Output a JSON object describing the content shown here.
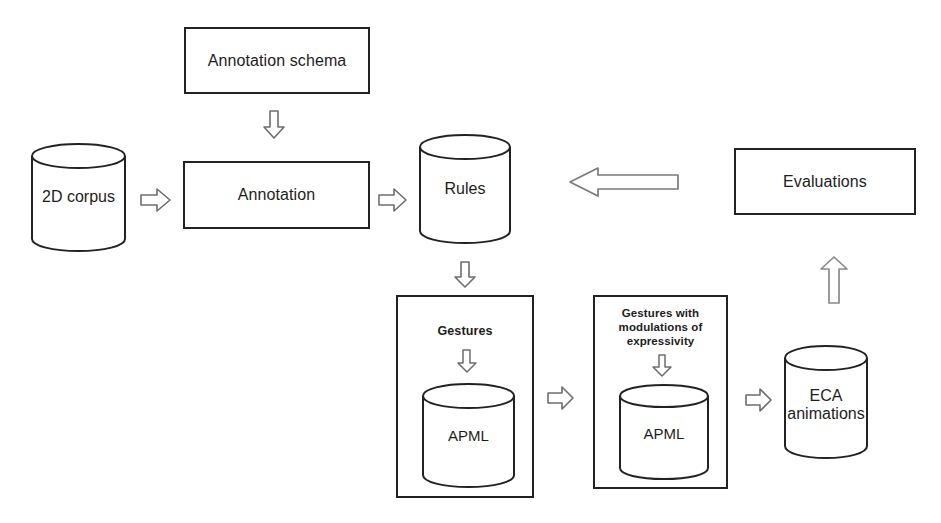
{
  "diagram": {
    "background_color": "#ffffff",
    "stroke_color": "#222222",
    "arrow_stroke_color": "#6d6d6d",
    "nodes": {
      "corpus": {
        "label": "2D corpus",
        "shape": "cylinder"
      },
      "annotation_schema": {
        "label": "Annotation schema",
        "shape": "rectangle"
      },
      "annotation": {
        "label": "Annotation",
        "shape": "rectangle"
      },
      "rules": {
        "label": "Rules",
        "shape": "cylinder"
      },
      "evaluations": {
        "label": "Evaluations",
        "shape": "rectangle"
      },
      "gestures_group": {
        "label": "Gestures",
        "shape": "group"
      },
      "gestures_apml": {
        "label": "APML",
        "shape": "cylinder"
      },
      "gestures_modulated_group": {
        "label": "Gestures with\nmodulations of\nexpressivity",
        "shape": "group"
      },
      "gestures_modulated_apml": {
        "label": "APML",
        "shape": "cylinder"
      },
      "eca_animations": {
        "label": "ECA\nanimations",
        "shape": "cylinder"
      }
    },
    "arrows": {
      "schema_to_annotation": {
        "icon": "arrow-down-icon",
        "direction": "down"
      },
      "corpus_to_annotation": {
        "icon": "arrow-right-icon",
        "direction": "right"
      },
      "annotation_to_rules": {
        "icon": "arrow-right-icon",
        "direction": "right"
      },
      "rules_to_gestures": {
        "icon": "arrow-down-icon",
        "direction": "down"
      },
      "evaluations_to_rules": {
        "icon": "arrow-left-long-icon",
        "direction": "left"
      },
      "eca_to_evaluations": {
        "icon": "arrow-up-icon",
        "direction": "up"
      },
      "gestures_title_to_apml": {
        "icon": "arrow-down-icon",
        "direction": "down"
      },
      "gestures_to_modulated": {
        "icon": "arrow-right-icon",
        "direction": "right"
      },
      "modulated_title_to_apml": {
        "icon": "arrow-down-icon",
        "direction": "down"
      },
      "modulated_to_eca": {
        "icon": "arrow-right-icon",
        "direction": "right"
      }
    }
  }
}
